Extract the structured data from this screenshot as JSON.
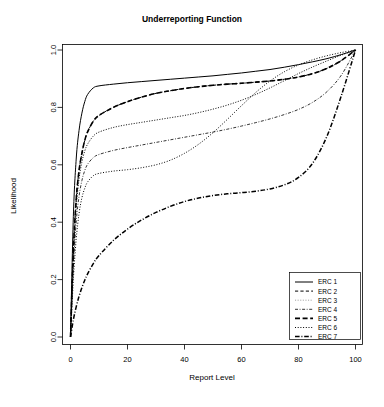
{
  "chart_data": {
    "type": "line",
    "title": "Underreporting Function",
    "xlabel": "Report Level",
    "ylabel": "Likelihood",
    "xlim": [
      0,
      100
    ],
    "ylim": [
      0,
      1.0
    ],
    "xticks": [
      0,
      20,
      40,
      60,
      80,
      100
    ],
    "yticks": [
      0.0,
      0.2,
      0.4,
      0.6,
      0.8,
      1.0
    ],
    "xtick_labels": [
      "0",
      "20",
      "40",
      "60",
      "80",
      "100"
    ],
    "ytick_labels": [
      "0.0",
      "0.2",
      "0.4",
      "0.6",
      "0.8",
      "1.0"
    ],
    "grid": false,
    "legend_position": "bottom-right",
    "x": [
      0,
      1,
      2,
      3,
      4,
      5,
      6,
      8,
      10,
      15,
      20,
      25,
      30,
      35,
      40,
      45,
      50,
      55,
      60,
      65,
      70,
      75,
      80,
      85,
      90,
      95,
      100
    ],
    "series": [
      {
        "name": "ERC 1",
        "dash": "solid",
        "color": "#000000",
        "values": [
          0.0,
          0.42,
          0.62,
          0.72,
          0.78,
          0.82,
          0.845,
          0.868,
          0.875,
          0.881,
          0.886,
          0.89,
          0.894,
          0.898,
          0.902,
          0.906,
          0.91,
          0.915,
          0.92,
          0.926,
          0.932,
          0.94,
          0.949,
          0.959,
          0.97,
          0.984,
          1.0
        ]
      },
      {
        "name": "ERC 2",
        "dash": "dashed",
        "color": "#000000",
        "values": [
          0.0,
          0.3,
          0.48,
          0.58,
          0.64,
          0.685,
          0.715,
          0.752,
          0.772,
          0.8,
          0.82,
          0.836,
          0.849,
          0.858,
          0.866,
          0.872,
          0.877,
          0.881,
          0.884,
          0.888,
          0.892,
          0.898,
          0.906,
          0.918,
          0.936,
          0.963,
          1.0
        ]
      },
      {
        "name": "ERC 3",
        "dash": "dotted-fine",
        "color": "#999999",
        "values": [
          0.0,
          0.28,
          0.45,
          0.55,
          0.61,
          0.648,
          0.672,
          0.7,
          0.714,
          0.73,
          0.74,
          0.748,
          0.756,
          0.764,
          0.772,
          0.782,
          0.794,
          0.808,
          0.825,
          0.845,
          0.868,
          0.893,
          0.918,
          0.941,
          0.962,
          0.982,
          1.0
        ]
      },
      {
        "name": "ERC 4",
        "dash": "dashdot-fine",
        "color": "#000000",
        "values": [
          0.0,
          0.24,
          0.4,
          0.49,
          0.545,
          0.58,
          0.602,
          0.625,
          0.636,
          0.65,
          0.66,
          0.669,
          0.678,
          0.687,
          0.696,
          0.705,
          0.714,
          0.724,
          0.735,
          0.747,
          0.76,
          0.775,
          0.793,
          0.818,
          0.855,
          0.912,
          1.0
        ]
      },
      {
        "name": "ERC 5",
        "dash": "longdash",
        "color": "#000000",
        "values": [
          0.0,
          0.3,
          0.48,
          0.58,
          0.64,
          0.685,
          0.715,
          0.752,
          0.772,
          0.8,
          0.82,
          0.836,
          0.849,
          0.858,
          0.866,
          0.872,
          0.877,
          0.881,
          0.884,
          0.888,
          0.892,
          0.898,
          0.906,
          0.918,
          0.936,
          0.963,
          1.0
        ]
      },
      {
        "name": "ERC 6",
        "dash": "dotted",
        "color": "#000000",
        "values": [
          0.0,
          0.2,
          0.34,
          0.43,
          0.485,
          0.518,
          0.54,
          0.562,
          0.57,
          0.578,
          0.583,
          0.59,
          0.6,
          0.616,
          0.64,
          0.672,
          0.712,
          0.758,
          0.806,
          0.852,
          0.892,
          0.924,
          0.948,
          0.966,
          0.98,
          0.991,
          1.0
        ]
      },
      {
        "name": "ERC 7",
        "dash": "dashdot",
        "color": "#000000",
        "values": [
          0.0,
          0.06,
          0.105,
          0.142,
          0.172,
          0.198,
          0.22,
          0.256,
          0.284,
          0.336,
          0.376,
          0.408,
          0.434,
          0.455,
          0.472,
          0.484,
          0.493,
          0.499,
          0.503,
          0.508,
          0.516,
          0.53,
          0.556,
          0.606,
          0.7,
          0.84,
          1.0
        ]
      }
    ]
  },
  "legend": {
    "entries": [
      "ERC 1",
      "ERC 2",
      "ERC 3",
      "ERC 4",
      "ERC 5",
      "ERC 6",
      "ERC 7"
    ]
  }
}
